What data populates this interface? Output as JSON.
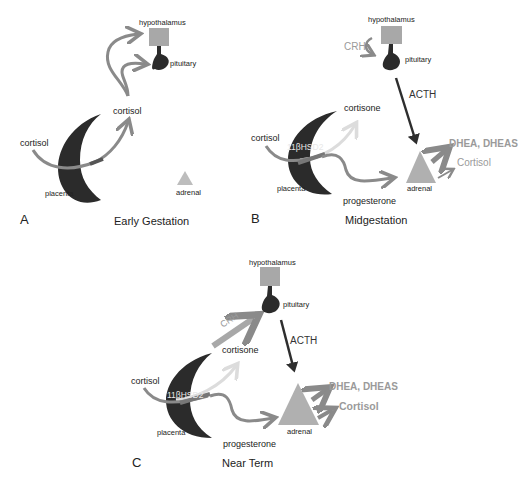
{
  "colors": {
    "placenta": "#2b2b2b",
    "hypothalamus": "#a8a8a8",
    "pituitary": "#2b2b2b",
    "adrenal": "#b0b0b0",
    "adrenal_small": "#bdbdbd",
    "arrow_gray": "#8a8a8a",
    "arrow_light": "#dcdcdc",
    "acth_arrow": "#2e2e2e",
    "crh_text": "#a0a0a0",
    "output_text": "#9a9a9a"
  },
  "panels": [
    {
      "letter": "A",
      "title": "Early Gestation",
      "labels": {
        "hypothalamus": "hypothalamus",
        "pituitary": "pituitary",
        "cortisol_maternal": "cortisol",
        "cortisol_fetal": "cortisol",
        "placenta": "placenta",
        "adrenal": "adrenal"
      }
    },
    {
      "letter": "B",
      "title": "Midgestation",
      "labels": {
        "hypothalamus": "hypothalamus",
        "pituitary": "pituitary",
        "crh": "CRH",
        "acth": "ACTH",
        "cortisone": "cortisone",
        "cortisol_maternal": "cortisol",
        "enzyme": "11βHSD2",
        "placenta": "placenta",
        "progesterone": "progesterone",
        "adrenal": "adrenal",
        "dhea": "DHEA, DHEAS",
        "cortisol_out": "Cortisol"
      }
    },
    {
      "letter": "C",
      "title": "Near Term",
      "labels": {
        "hypothalamus": "hypothalamus",
        "pituitary": "pituitary",
        "crh": "CRH",
        "acth": "ACTH",
        "cortisone": "cortisone",
        "cortisol_maternal": "cortisol",
        "enzyme": "11βHSD2",
        "placenta": "placenta",
        "progesterone": "progesterone",
        "adrenal": "adrenal",
        "dhea": "DHEA, DHEAS",
        "cortisol_out": "Cortisol"
      }
    }
  ]
}
